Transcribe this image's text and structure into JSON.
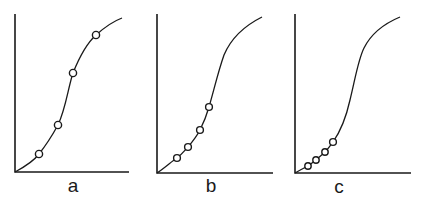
{
  "figure": {
    "panels": [
      {
        "label": "a",
        "origin": [
          15,
          172
        ],
        "y_axis_top": 14,
        "x_axis_end": 129,
        "curve_path": "M15,172 C28,165 36,158 39,154 C47,144 53,134 58,125 C66,108 68,88 73,73 C79,58 86,44 96,35 C106,26 114,21 122,18",
        "points": [
          [
            39,
            154
          ],
          [
            58,
            125
          ],
          [
            73,
            73
          ],
          [
            96,
            35
          ]
        ],
        "label_pos": [
          73,
          192
        ]
      },
      {
        "label": "b",
        "origin": [
          157,
          173
        ],
        "y_axis_top": 14,
        "x_axis_end": 273,
        "curve_path": "M157,173 C166,167 172,161 177,158 C182,154 185,150 188,147 C193,141 197,136 200,130 C204,122 207,114 209,107 C214,90 218,72 224,55 C232,36 248,24 262,17",
        "points": [
          [
            177,
            158
          ],
          [
            188,
            147
          ],
          [
            200,
            130
          ],
          [
            209,
            107
          ]
        ],
        "label_pos": [
          211,
          192
        ]
      },
      {
        "label": "c",
        "origin": [
          295,
          173
        ],
        "y_axis_top": 14,
        "x_axis_end": 411,
        "curve_path": "M295,173 C300,170 304,168 308,166 C311,164 313,162 316,160 C319,157 322,155 325,152 C328,149 330,146 333,142 C340,132 346,118 350,100 C355,80 358,60 364,48 C372,32 388,22 400,17",
        "points": [
          [
            308,
            166
          ],
          [
            316,
            160
          ],
          [
            325,
            152
          ],
          [
            333,
            142
          ]
        ],
        "label_pos": [
          339,
          193
        ]
      }
    ],
    "colors": {
      "ink": "#1a1a1a",
      "background": "#ffffff"
    }
  }
}
